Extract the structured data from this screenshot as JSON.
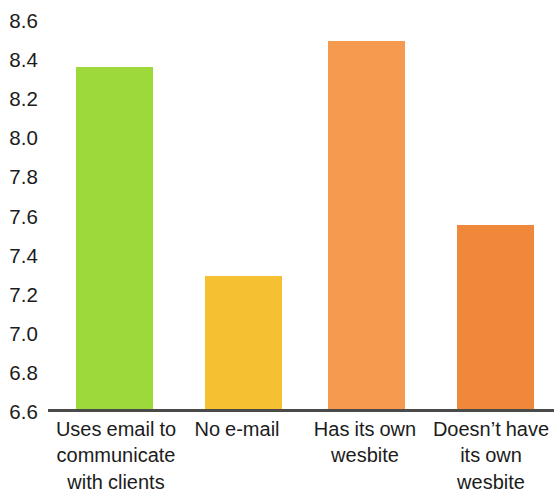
{
  "chart_data": {
    "type": "bar",
    "title": "",
    "subtitle": "",
    "xlabel": "",
    "ylabel": "",
    "grid": false,
    "legend": "none",
    "ylim": [
      6.6,
      8.6
    ],
    "ytick_step": 0.2,
    "yticks": [
      "8.6",
      "8.4",
      "8.2",
      "8.0",
      "7.8",
      "7.6",
      "7.4",
      "7.2",
      "7.0",
      "6.8",
      "6.6"
    ],
    "ytick_values": [
      8.6,
      8.4,
      8.2,
      8.0,
      7.8,
      7.6,
      7.4,
      7.2,
      7.0,
      6.8,
      6.6
    ],
    "categories": [
      "Uses email to communicate with clients",
      "No e-mail",
      "Has its own wesbite",
      "Doesn’t have its own wesbite"
    ],
    "values": [
      8.35,
      7.28,
      8.48,
      7.54
    ],
    "colors": [
      "#9ED93C",
      "#F5C032",
      "#F59A4E",
      "#F0883C"
    ],
    "bars": [
      {
        "label": "Uses email to communicate with clients",
        "value": 8.35,
        "color": "#9ED93C"
      },
      {
        "label": "No e-mail",
        "value": 7.28,
        "color": "#F5C032"
      },
      {
        "label": "Has its own wesbite",
        "value": 8.48,
        "color": "#F59A4E"
      },
      {
        "label": "Doesn’t have its own wesbite",
        "value": 7.54,
        "color": "#F0883C"
      }
    ],
    "axis_color": "#4a4a48",
    "background": "#ffffff"
  }
}
